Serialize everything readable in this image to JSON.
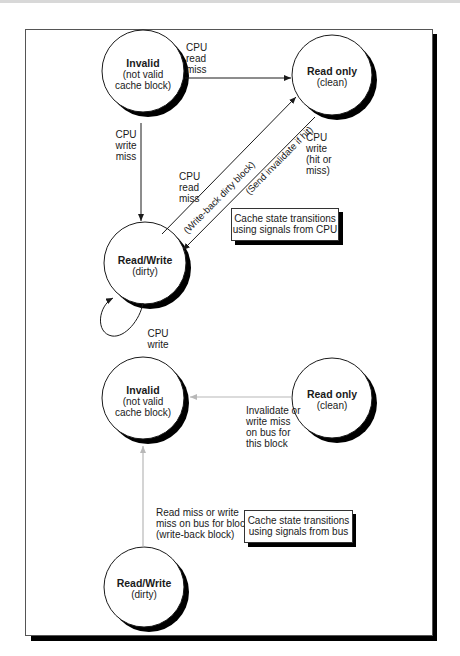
{
  "figure": {
    "colors": {
      "cpu_arrow": "#1a1a1a",
      "bus_arrow": "#b8b8b8",
      "shadow": "#000000",
      "background": "#ffffff"
    }
  },
  "cpu_diagram": {
    "states": [
      {
        "id": "invalid",
        "title": "Invalid",
        "subtitle_line1": "(not valid",
        "subtitle_line2": "cache block)"
      },
      {
        "id": "read_only",
        "title": "Read only",
        "subtitle_line1": "(clean)"
      },
      {
        "id": "read_write",
        "title": "Read/Write",
        "subtitle_line1": "(dirty)"
      }
    ],
    "transitions": [
      {
        "from": "invalid",
        "to": "read_only",
        "label_lines": [
          "CPU",
          "read",
          "miss"
        ]
      },
      {
        "from": "invalid",
        "to": "read_write",
        "label_lines": [
          "CPU",
          "write",
          "miss"
        ]
      },
      {
        "from": "read_write",
        "to": "read_only",
        "label_lines": [
          "CPU",
          "read",
          "miss"
        ],
        "action": "(Write-back dirty block)"
      },
      {
        "from": "read_only",
        "to": "read_write",
        "label_lines": [
          "CPU",
          "write",
          "(hit or",
          "miss)"
        ],
        "action": "(Send invalidate if hit)"
      },
      {
        "from": "read_write",
        "to": "read_write",
        "label_lines": [
          "CPU",
          "write"
        ]
      }
    ],
    "caption_lines": [
      "Cache state transitions",
      "using signals from CPU"
    ]
  },
  "bus_diagram": {
    "states": [
      {
        "id": "invalid",
        "title": "Invalid",
        "subtitle_line1": "(not valid",
        "subtitle_line2": "cache block)"
      },
      {
        "id": "read_only",
        "title": "Read only",
        "subtitle_line1": "(clean)"
      },
      {
        "id": "read_write",
        "title": "Read/Write",
        "subtitle_line1": "(dirty)"
      }
    ],
    "transitions": [
      {
        "from": "read_only",
        "to": "invalid",
        "label_lines": [
          "Invalidate or",
          "write miss",
          "on bus for",
          "this block"
        ]
      },
      {
        "from": "read_write",
        "to": "invalid",
        "label_lines": [
          "Read miss or write",
          "miss on bus for block",
          "(write-back block)"
        ]
      }
    ],
    "caption_lines": [
      "Cache state transitions",
      "using signals from bus"
    ]
  }
}
